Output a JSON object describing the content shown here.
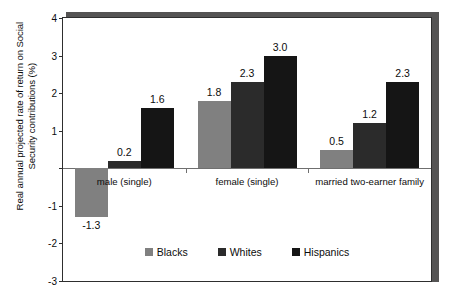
{
  "chart_data": {
    "type": "bar",
    "title": "",
    "xlabel": "",
    "ylabel": "Real annual projected rate of return on Social Security contributions (%)",
    "ylim": [
      -3,
      4
    ],
    "yticks": [
      4,
      3,
      2,
      1,
      0,
      -1,
      -2,
      -3
    ],
    "ytick_labels": [
      "4",
      "3",
      "2",
      "1",
      "",
      "-1",
      "-2",
      "-3"
    ],
    "grid": false,
    "legend_position": "bottom-inside",
    "zero_line": true,
    "categories": [
      "male (single)",
      "female (single)",
      "married two-earner family"
    ],
    "series": [
      {
        "name": "Blacks",
        "color": "#808080",
        "values": [
          -1.3,
          1.8,
          0.5
        ],
        "labels": [
          "-1.3",
          "1.8",
          "0.5"
        ]
      },
      {
        "name": "Whites",
        "color": "#2b2b2b",
        "values": [
          0.2,
          2.3,
          1.2
        ],
        "labels": [
          "0.2",
          "2.3",
          "1.2"
        ]
      },
      {
        "name": "Hispanics",
        "color": "#151515",
        "values": [
          1.6,
          3.0,
          2.3
        ],
        "labels": [
          "1.6",
          "3.0",
          "2.3"
        ]
      }
    ]
  },
  "colors": {
    "frame_shadow": "#555454",
    "frame_line": "#2e2e2e",
    "zero_line": "#6f6f6f",
    "text": "#0c0c0c",
    "background": "#ffffff"
  }
}
